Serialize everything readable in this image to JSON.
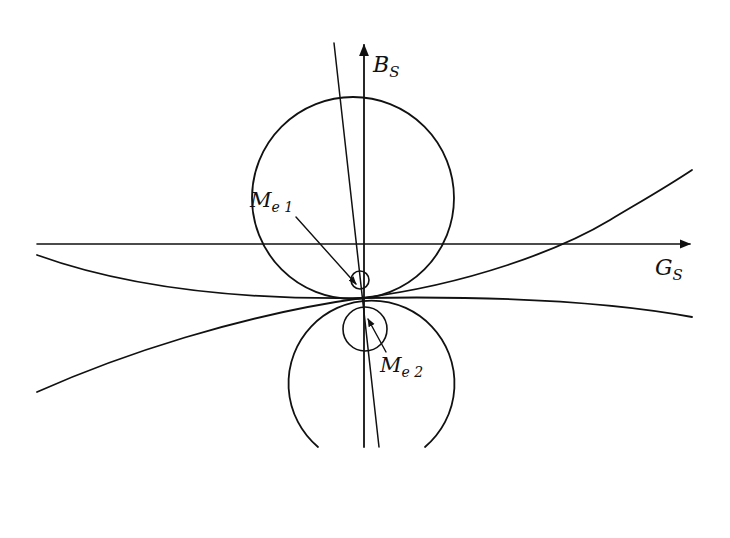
{
  "diagram": {
    "axes": {
      "horizontal": {
        "label_main": "G",
        "label_sub": "S"
      },
      "vertical": {
        "label_main": "B",
        "label_sub": "S"
      }
    },
    "annotations": [
      {
        "id": "me1",
        "label_main": "M",
        "label_sub": "e 1"
      },
      {
        "id": "me2",
        "label_main": "M",
        "label_sub": "e 2"
      }
    ],
    "colors": {
      "stroke": "#111111",
      "background": "#ffffff"
    }
  }
}
